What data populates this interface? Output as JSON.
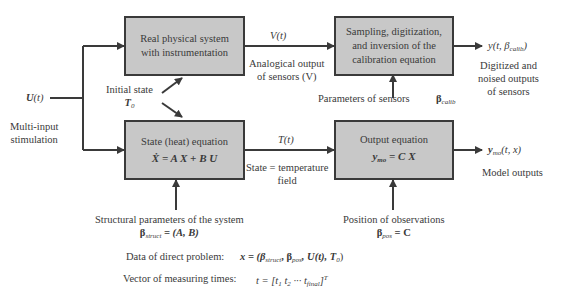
{
  "boxes": {
    "physical": {
      "line1": "Real physical system",
      "line2": "with instrumentation"
    },
    "sampling": {
      "line1": "Sampling, digitization,",
      "line2": "and inversion of the",
      "line3": "calibration equation"
    },
    "state": {
      "title": "State (heat) equation",
      "equation": "Ẋ = A X + B U"
    },
    "output": {
      "title": "Output equation",
      "eq_lhs": "y",
      "eq_sub": "mo",
      "eq_rhs": " = C X"
    }
  },
  "labels": {
    "input_symbol": "U",
    "input_arg": "(t)",
    "input_desc_1": "Multi-input",
    "input_desc_2": "stimulation",
    "initial_state": "Initial state",
    "initial_symbol": "T",
    "initial_sub": "0",
    "v_signal": "V(t)",
    "v_desc_1": "Analogical output",
    "v_desc_2": "of sensors (V)",
    "t_signal": "T(t)",
    "t_desc_1": "State = temperature",
    "t_desc_2": "field",
    "sensor_params": "Parameters of sensors",
    "beta_calib": "β",
    "beta_calib_sub": "calib",
    "y_out_prefix": "y(t, β",
    "y_out_sub": "calib",
    "y_out_suffix": ")",
    "y_desc_1": "Digitized and",
    "y_desc_2": "noised outputs",
    "y_desc_3": "of sensors",
    "ymo_symbol": "y",
    "ymo_sub": "mo",
    "ymo_args": "(t, x)",
    "ymo_desc": "Model outputs",
    "struct_desc": "Structural parameters of the system",
    "beta_struct": "β",
    "beta_struct_sub": "struct",
    "beta_struct_val": " = (A, B)",
    "pos_desc": "Position of observations",
    "beta_pos": "β",
    "beta_pos_sub": "pos",
    "beta_pos_val": " = C"
  },
  "footer": {
    "direct_label": "Data of direct problem:",
    "direct_formula_prefix": "x = (β",
    "direct_sub1": "struct",
    "direct_mid1": ", β",
    "direct_sub2": "pos",
    "direct_mid2": ", U(t), T",
    "direct_sub3": "0",
    "direct_suffix": ")",
    "times_label": "Vector of measuring times:",
    "times_prefix": "t = [t",
    "times_sub1": "1",
    "times_mid1": " t",
    "times_sub2": "2",
    "times_mid2": " ··· t",
    "times_sub3": "final",
    "times_suffix": "]",
    "times_sup": "T"
  },
  "colors": {
    "box_fill": "#c8c8c8",
    "stroke": "#3a3a3a",
    "background": "#ffffff"
  }
}
